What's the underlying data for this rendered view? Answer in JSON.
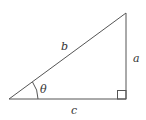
{
  "diagram": {
    "type": "right-triangle",
    "stroke_color": "#555555",
    "labels": {
      "hypotenuse": "b",
      "opposite": "a",
      "adjacent": "c",
      "angle": "θ"
    }
  }
}
